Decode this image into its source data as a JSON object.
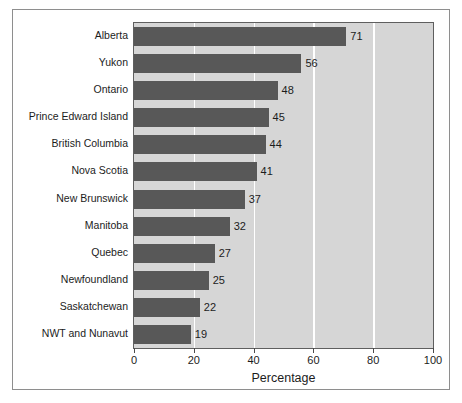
{
  "chart_data": {
    "type": "bar",
    "orientation": "horizontal",
    "title": "",
    "xlabel": "Percentage",
    "ylabel": "",
    "xlim": [
      0,
      100
    ],
    "xticks": [
      0,
      20,
      40,
      60,
      80,
      100
    ],
    "xtick_labels": [
      "0",
      "20",
      "40",
      "60",
      "80",
      "100"
    ],
    "grid": true,
    "grid_axis": "x",
    "legend": false,
    "categories": [
      "Alberta",
      "Yukon",
      "Ontario",
      "Prince Edward Island",
      "British Columbia",
      "Nova Scotia",
      "New Brunswick",
      "Manitoba",
      "Quebec",
      "Newfoundland",
      "Saskatchewan",
      "NWT and Nunavut"
    ],
    "values": [
      71,
      56,
      48,
      45,
      44,
      41,
      37,
      32,
      27,
      25,
      22,
      19
    ],
    "value_labels": [
      "71",
      "56",
      "48",
      "45",
      "44",
      "41",
      "37",
      "32",
      "27",
      "25",
      "22",
      "19"
    ],
    "colors": {
      "bar": "#585858",
      "plot_background": "#d6d6d6",
      "gridline": "#ffffff",
      "axis": "#5f5f5f",
      "text": "#1c1c1c",
      "figure_border": "#8e8e8e",
      "figure_background": "#ffffff"
    }
  }
}
